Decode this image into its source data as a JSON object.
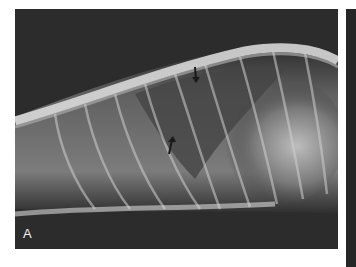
{
  "figure": {
    "panels": [
      {
        "label": "A",
        "description": "Lateral thoracic radiograph with two arrows",
        "annotations": [
          {
            "type": "arrow",
            "direction": "down",
            "name": "arrow-dorsal"
          },
          {
            "type": "arrow",
            "direction": "up-right",
            "name": "arrow-ventral"
          }
        ]
      },
      {
        "label": "",
        "description": "Adjacent panel (cropped)"
      }
    ]
  }
}
